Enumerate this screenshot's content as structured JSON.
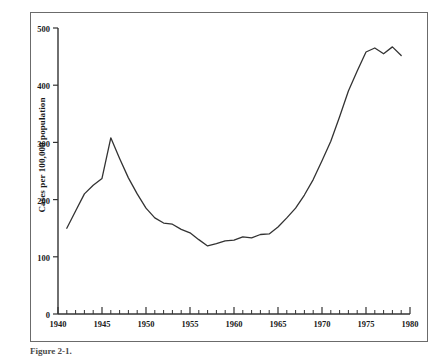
{
  "figure": {
    "caption_partial": "Figure 2-1.",
    "background_color": "#ffffff",
    "line_color": "#333333",
    "frame_color": "#6b6b6b"
  },
  "chart_data": {
    "type": "line",
    "title": "",
    "xlabel": "",
    "ylabel": "Cases per 100,000 population",
    "xlim": [
      1940,
      1980
    ],
    "ylim": [
      0,
      500
    ],
    "grid": false,
    "legend": null,
    "x_ticks_major": [
      1940,
      1945,
      1950,
      1955,
      1960,
      1965,
      1970,
      1975,
      1980
    ],
    "x_tick_labels": [
      "1940",
      "1945",
      "1950",
      "1955",
      "1960",
      "1965",
      "1970",
      "1975",
      "1980"
    ],
    "x_minor_tick_interval": 1,
    "y_ticks": [
      0,
      100,
      200,
      300,
      400,
      500
    ],
    "y_tick_labels": [
      "0",
      "100",
      "200",
      "300",
      "400",
      "500"
    ],
    "series": [
      {
        "name": "Cases per 100,000 population",
        "x": [
          1941,
          1942,
          1943,
          1944,
          1945,
          1946,
          1947,
          1948,
          1949,
          1950,
          1951,
          1952,
          1953,
          1954,
          1955,
          1956,
          1957,
          1958,
          1959,
          1960,
          1961,
          1962,
          1963,
          1964,
          1965,
          1966,
          1967,
          1968,
          1969,
          1970,
          1971,
          1972,
          1973,
          1974,
          1975,
          1976,
          1977,
          1978,
          1979
        ],
        "values": [
          150,
          180,
          210,
          225,
          237,
          308,
          272,
          238,
          210,
          185,
          168,
          159,
          157,
          148,
          142,
          130,
          119,
          123,
          128,
          129,
          135,
          133,
          139,
          140,
          152,
          168,
          185,
          208,
          235,
          268,
          302,
          345,
          390,
          425,
          458,
          465,
          455,
          467,
          452
        ]
      }
    ]
  }
}
